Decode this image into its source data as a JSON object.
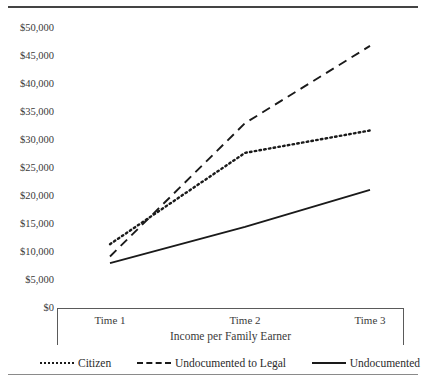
{
  "figure": {
    "clipped_header_text": "",
    "background": "#ffffff",
    "ink_color": "#1a1a1a",
    "axis_color": "#5a5a5a"
  },
  "chart_data": {
    "type": "line",
    "title": "",
    "xlabel": "Income per Family Earner",
    "ylabel": "",
    "categories": [
      "Time 1",
      "Time 2",
      "Time 3"
    ],
    "ylim": [
      0,
      50000
    ],
    "ytick_labels": [
      "$50,000",
      "$45,000",
      "$40,000",
      "$35,000",
      "$30,000",
      "$25,000",
      "$20,000",
      "$15,000",
      "$10,000",
      "$5,000",
      "$0"
    ],
    "ytick_values": [
      50000,
      45000,
      40000,
      35000,
      30000,
      25000,
      20000,
      15000,
      10000,
      5000,
      0
    ],
    "grid": false,
    "legend_position": "bottom",
    "series": [
      {
        "name": "Citizen",
        "style": "dotted",
        "color": "#1a1a1a",
        "values": [
          11400,
          27700,
          31700
        ]
      },
      {
        "name": "Undocumented to Legal",
        "style": "dashed",
        "color": "#1a1a1a",
        "values": [
          9200,
          33000,
          46800
        ]
      },
      {
        "name": "Undocumented",
        "style": "solid",
        "color": "#1a1a1a",
        "values": [
          8000,
          14500,
          21100
        ]
      }
    ]
  },
  "legend": {
    "items": [
      {
        "label": "Citizen",
        "swatch": "dotted-line-swatch"
      },
      {
        "label": "Undocumented to Legal",
        "swatch": "dashed-line-swatch"
      },
      {
        "label": "Undocumented",
        "swatch": "solid-line-swatch"
      }
    ]
  }
}
